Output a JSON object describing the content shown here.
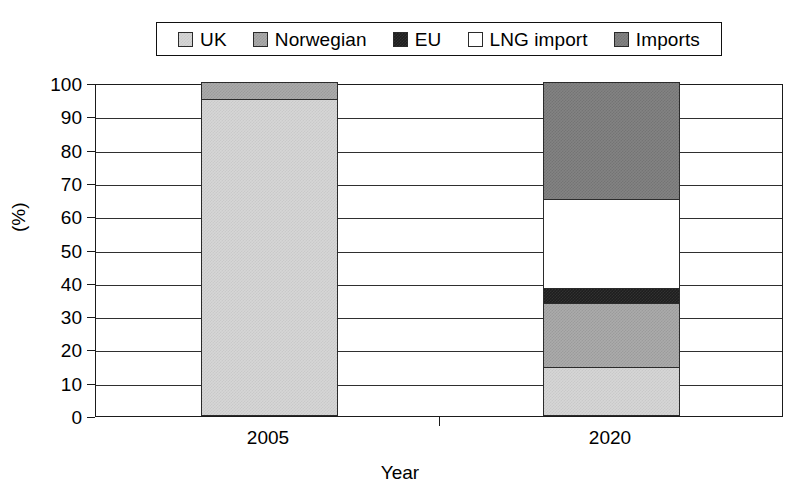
{
  "chart_data": {
    "type": "bar",
    "subtype": "stacked-bar-100",
    "title": "",
    "xlabel": "Year",
    "ylabel": "(%)",
    "categories": [
      "2005",
      "2020"
    ],
    "ylim": [
      0,
      100
    ],
    "yticks": [
      0,
      10,
      20,
      30,
      40,
      50,
      60,
      70,
      80,
      90,
      100
    ],
    "ytick_labels": [
      "0",
      "10",
      "20",
      "30",
      "40",
      "50",
      "60",
      "70",
      "80",
      "90",
      "100"
    ],
    "grid": true,
    "grid_axis": "y",
    "legend_position": "top",
    "legend_entries": [
      "UK",
      "Norwegian",
      "EU",
      "LNG import",
      "Imports"
    ],
    "series": [
      {
        "name": "UK",
        "color": "#d6d6d6",
        "values": [
          95.0,
          14.5
        ]
      },
      {
        "name": "Norwegian",
        "color": "#ababab",
        "values": [
          5.0,
          19.0
        ]
      },
      {
        "name": "EU",
        "color": "#1e1e1e",
        "values": [
          0.0,
          4.5
        ]
      },
      {
        "name": "LNG import",
        "color": "#ffffff",
        "values": [
          0.0,
          27.0
        ]
      },
      {
        "name": "Imports",
        "color": "#838383",
        "values": [
          0.0,
          35.0
        ]
      }
    ],
    "stack_boundaries": {
      "2005": [
        0,
        95,
        100,
        100,
        100,
        100
      ],
      "2020": [
        0,
        14.5,
        33.5,
        38,
        65,
        100
      ]
    }
  },
  "legend": {
    "items": [
      {
        "label": "UK",
        "swatch": "swatch-uk",
        "color": "#d6d6d6"
      },
      {
        "label": "Norwegian",
        "swatch": "swatch-norwegian",
        "color": "#ababab"
      },
      {
        "label": "EU",
        "swatch": "swatch-eu",
        "color": "#1e1e1e"
      },
      {
        "label": "LNG import",
        "swatch": "swatch-lng-import",
        "color": "#ffffff"
      },
      {
        "label": "Imports",
        "swatch": "swatch-imports",
        "color": "#838383"
      }
    ]
  },
  "axes": {
    "y_title": "(%)",
    "x_title": "Year",
    "y_labels": [
      "100",
      "90",
      "80",
      "70",
      "60",
      "50",
      "40",
      "30",
      "20",
      "10",
      "0"
    ],
    "x_labels": [
      "2005",
      "2020"
    ]
  }
}
